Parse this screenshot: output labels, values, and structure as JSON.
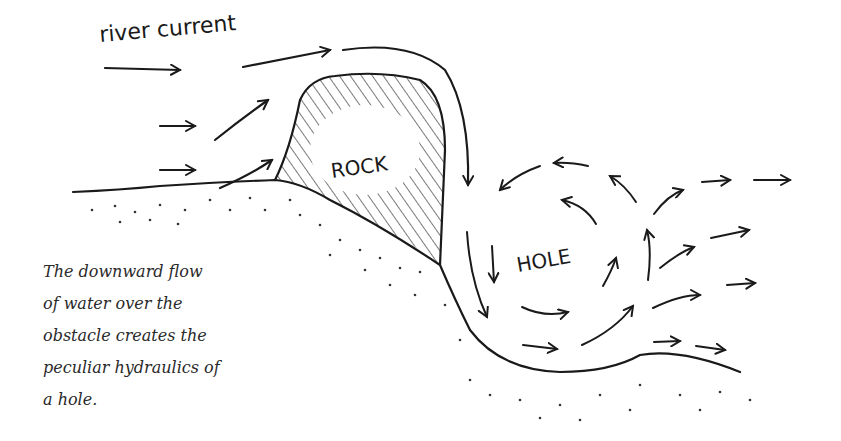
{
  "diagram": {
    "labels": {
      "current": "river current",
      "rock": "ROCK",
      "hole": "HOLE"
    },
    "caption_lines": [
      "The downward flow",
      "of water over the",
      "obstacle creates the",
      "peculiar hydraulics of",
      "a hole."
    ],
    "colors": {
      "ink": "#1a1a1a",
      "background": "#ffffff"
    }
  }
}
